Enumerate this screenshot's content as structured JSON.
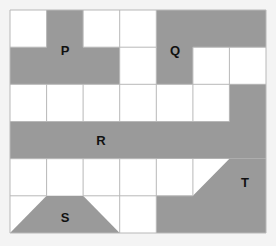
{
  "diagram": {
    "grid": {
      "cols": 7,
      "rows": 6,
      "line_color": "#b8b8b8",
      "cell_fill": "#ffffff"
    },
    "shape_color": "#9a9a9a",
    "shapes": [
      {
        "label": "P"
      },
      {
        "label": "Q"
      },
      {
        "label": "R"
      },
      {
        "label": "S"
      },
      {
        "label": "T"
      }
    ]
  }
}
